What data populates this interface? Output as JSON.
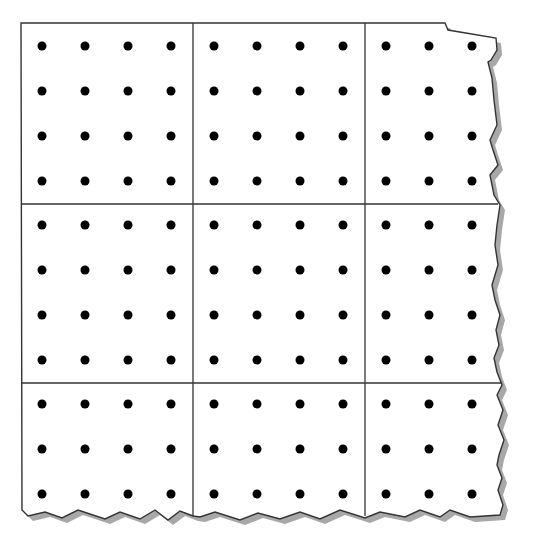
{
  "diagram": {
    "type": "dot-grid-paper",
    "colors": {
      "paper": "#ffffff",
      "line": "#333333",
      "dot": "#000000",
      "shadow": "#9a9a9a"
    },
    "grid": {
      "vertical_lines_x": [
        21,
        193,
        365
      ],
      "horizontal_lines_y": [
        23,
        204,
        383
      ],
      "right_edge_x": 503,
      "bottom_edge_y": 513
    },
    "dots": {
      "columns_x": [
        42,
        85,
        128,
        171,
        214,
        257,
        300,
        343,
        386,
        429,
        472
      ],
      "rows_y": [
        46,
        91,
        136,
        181,
        225,
        270,
        315,
        360,
        404,
        449,
        494
      ]
    }
  }
}
